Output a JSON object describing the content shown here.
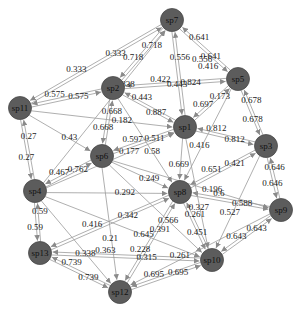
{
  "diagram": {
    "type": "directed-weighted-network",
    "node_color": "#5c5c5c",
    "edge_color": "#9a9a9a",
    "nodes": [
      {
        "id": "sp7",
        "label": "sp7",
        "x": 172,
        "y": 20
      },
      {
        "id": "sp5",
        "label": "sp5",
        "x": 238,
        "y": 79
      },
      {
        "id": "sp2",
        "label": "sp2",
        "x": 113,
        "y": 88
      },
      {
        "id": "sp11",
        "label": "sp11",
        "x": 20,
        "y": 108
      },
      {
        "id": "sp1",
        "label": "sp1",
        "x": 185,
        "y": 127
      },
      {
        "id": "sp3",
        "label": "sp3",
        "x": 266,
        "y": 146
      },
      {
        "id": "sp6",
        "label": "sp6",
        "x": 102,
        "y": 156
      },
      {
        "id": "sp4",
        "label": "sp4",
        "x": 35,
        "y": 191
      },
      {
        "id": "sp8",
        "label": "sp8",
        "x": 180,
        "y": 192
      },
      {
        "id": "sp9",
        "label": "sp9",
        "x": 281,
        "y": 210
      },
      {
        "id": "sp13",
        "label": "sp13",
        "x": 40,
        "y": 253
      },
      {
        "id": "sp10",
        "label": "sp10",
        "x": 212,
        "y": 260
      },
      {
        "id": "sp12",
        "label": "sp12",
        "x": 120,
        "y": 292
      }
    ],
    "edges": [
      {
        "from": "sp11",
        "to": "sp7",
        "weight": "0.333"
      },
      {
        "from": "sp7",
        "to": "sp11",
        "weight": "0.333"
      },
      {
        "from": "sp2",
        "to": "sp7",
        "weight": "0.718"
      },
      {
        "from": "sp7",
        "to": "sp2",
        "weight": "0.718"
      },
      {
        "from": "sp7",
        "to": "sp5",
        "weight": "0.641"
      },
      {
        "from": "sp5",
        "to": "sp7",
        "weight": "0.641"
      },
      {
        "from": "sp1",
        "to": "sp7",
        "weight": "0.556"
      },
      {
        "from": "sp7",
        "to": "sp1",
        "weight": "0.443"
      },
      {
        "from": "sp11",
        "to": "sp2",
        "weight": "0.575"
      },
      {
        "from": "sp2",
        "to": "sp11",
        "weight": "0.575"
      },
      {
        "from": "sp2",
        "to": "sp5",
        "weight": "0.824"
      },
      {
        "from": "sp5",
        "to": "sp2",
        "weight": "0.422"
      },
      {
        "from": "sp2",
        "to": "sp1",
        "weight": "0.887"
      },
      {
        "from": "sp1",
        "to": "sp2",
        "weight": "0.443"
      },
      {
        "from": "sp11",
        "to": "sp6",
        "weight": "0.43"
      },
      {
        "from": "sp11",
        "to": "sp4",
        "weight": "0.27"
      },
      {
        "from": "sp4",
        "to": "sp11",
        "weight": "0.27"
      },
      {
        "from": "sp2",
        "to": "sp6",
        "weight": "0.668"
      },
      {
        "from": "sp6",
        "to": "sp2",
        "weight": "0.668"
      },
      {
        "from": "sp5",
        "to": "sp1",
        "weight": "0.697"
      },
      {
        "from": "sp1",
        "to": "sp5",
        "weight": "0.173"
      },
      {
        "from": "sp5",
        "to": "sp3",
        "weight": "0.678"
      },
      {
        "from": "sp3",
        "to": "sp5",
        "weight": "0.678"
      },
      {
        "from": "sp5",
        "to": "sp8",
        "weight": "0.416"
      },
      {
        "from": "sp3",
        "to": "sp9",
        "weight": "0.646"
      },
      {
        "from": "sp9",
        "to": "sp3",
        "weight": "0.646"
      },
      {
        "from": "sp1",
        "to": "sp3",
        "weight": "0.812"
      },
      {
        "from": "sp3",
        "to": "sp1",
        "weight": "0.812"
      },
      {
        "from": "sp1",
        "to": "sp6",
        "weight": "0.597"
      },
      {
        "from": "sp6",
        "to": "sp1",
        "weight": "0.511"
      },
      {
        "from": "sp1",
        "to": "sp8",
        "weight": "0.669"
      },
      {
        "from": "sp3",
        "to": "sp8",
        "weight": "0.651"
      },
      {
        "from": "sp8",
        "to": "sp3",
        "weight": "0.421"
      },
      {
        "from": "sp9",
        "to": "sp8",
        "weight": "0.6"
      },
      {
        "from": "sp8",
        "to": "sp9",
        "weight": "0.588"
      },
      {
        "from": "sp3",
        "to": "sp10",
        "weight": "0.527"
      },
      {
        "from": "sp9",
        "to": "sp10",
        "weight": "0.643"
      },
      {
        "from": "sp10",
        "to": "sp9",
        "weight": "0.643"
      },
      {
        "from": "sp6",
        "to": "sp4",
        "weight": "0.467"
      },
      {
        "from": "sp4",
        "to": "sp6",
        "weight": "0.762"
      },
      {
        "from": "sp6",
        "to": "sp8",
        "weight": "0.249"
      },
      {
        "from": "sp4",
        "to": "sp8",
        "weight": "0.292"
      },
      {
        "from": "sp4",
        "to": "sp13",
        "weight": "0.59"
      },
      {
        "from": "sp13",
        "to": "sp4",
        "weight": "0.59"
      },
      {
        "from": "sp4",
        "to": "sp10",
        "weight": "0.645"
      },
      {
        "from": "sp4",
        "to": "sp12",
        "weight": "0.338"
      },
      {
        "from": "sp8",
        "to": "sp13",
        "weight": "0.416"
      },
      {
        "from": "sp8",
        "to": "sp12",
        "weight": "0.228"
      },
      {
        "from": "sp8",
        "to": "sp10",
        "weight": "0.451"
      },
      {
        "from": "sp6",
        "to": "sp10",
        "weight": "0.566"
      },
      {
        "from": "sp6",
        "to": "sp12",
        "weight": "0.21"
      },
      {
        "from": "sp13",
        "to": "sp12",
        "weight": "0.739"
      },
      {
        "from": "sp12",
        "to": "sp13",
        "weight": "0.739"
      },
      {
        "from": "sp13",
        "to": "sp10",
        "weight": "0.315"
      },
      {
        "from": "sp10",
        "to": "sp13",
        "weight": "0.363"
      },
      {
        "from": "sp12",
        "to": "sp10",
        "weight": "0.695"
      },
      {
        "from": "sp10",
        "to": "sp12",
        "weight": "0.695"
      },
      {
        "from": "sp10",
        "to": "sp8",
        "weight": "0.261"
      },
      {
        "from": "sp9",
        "to": "sp12",
        "weight": "0.261"
      },
      {
        "from": "sp12",
        "to": "sp8",
        "weight": "0.391"
      },
      {
        "from": "sp1",
        "to": "sp10",
        "weight": "0.327"
      },
      {
        "from": "sp4",
        "to": "sp1",
        "weight": "0.177"
      },
      {
        "from": "sp13",
        "to": "sp8",
        "weight": "0.342"
      },
      {
        "from": "sp6",
        "to": "sp9",
        "weight": "0.196"
      },
      {
        "from": "sp2",
        "to": "sp8",
        "weight": "0.58"
      },
      {
        "from": "sp11",
        "to": "sp1",
        "weight": "0.182"
      },
      {
        "from": "sp4",
        "to": "sp7",
        "weight": "0.0838"
      }
    ],
    "misc_labels": [
      {
        "text": "0.556",
        "x": 192,
        "y": 62
      },
      {
        "text": "0.416",
        "x": 198,
        "y": 69
      }
    ]
  }
}
